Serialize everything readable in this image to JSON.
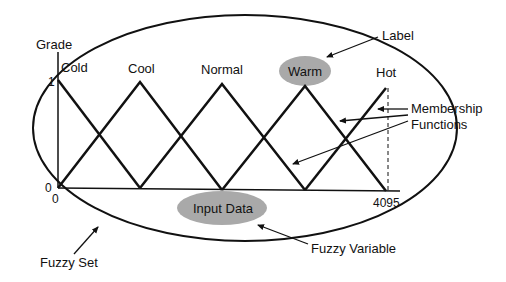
{
  "axis": {
    "y_title": "Grade",
    "y_max_label": "1",
    "y_min_label": "0",
    "x_min_label": "0",
    "x_max_label": "4095"
  },
  "memberships": [
    {
      "name": "Cold",
      "peak_x": 58
    },
    {
      "name": "Cool",
      "peak_x": 140
    },
    {
      "name": "Normal",
      "peak_x": 222
    },
    {
      "name": "Warm",
      "peak_x": 305,
      "highlighted": true
    },
    {
      "name": "Hot",
      "peak_x": 386
    }
  ],
  "annotations": {
    "label": "Label",
    "membership_functions_1": "Membership",
    "membership_functions_2": "Functions",
    "input_data": "Input Data",
    "fuzzy_variable": "Fuzzy Variable",
    "fuzzy_set": "Fuzzy Set"
  },
  "colors": {
    "line": "#111111",
    "highlight_fill": "#a9a9a9",
    "background": "#ffffff"
  }
}
